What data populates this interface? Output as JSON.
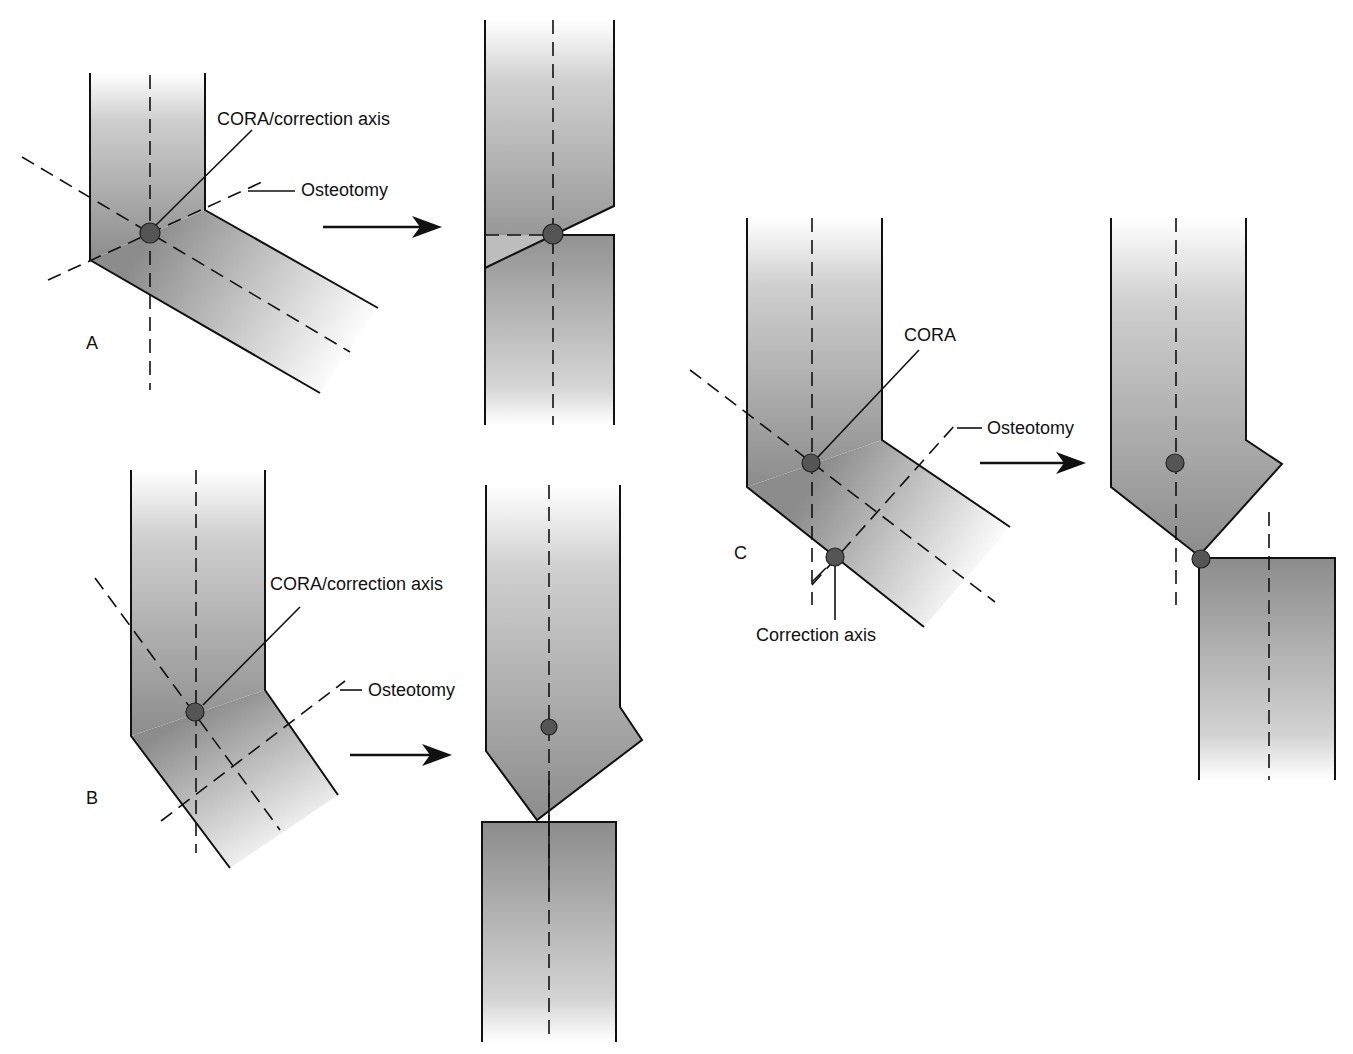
{
  "figure": {
    "panels": [
      {
        "id": "A",
        "label": "A",
        "cora_label": "CORA/correction axis",
        "osteotomy_label": "Osteotomy"
      },
      {
        "id": "B",
        "label": "B",
        "cora_label": "CORA/correction axis",
        "osteotomy_label": "Osteotomy"
      },
      {
        "id": "C",
        "label": "C",
        "cora_label": "CORA",
        "osteotomy_label": "Osteotomy",
        "correction_axis_label": "Correction axis"
      }
    ]
  },
  "colors": {
    "bone_dark": "#8a8a8a",
    "bone_light": "#ffffff",
    "outline": "#111111",
    "pivot_dot": "#555555"
  }
}
